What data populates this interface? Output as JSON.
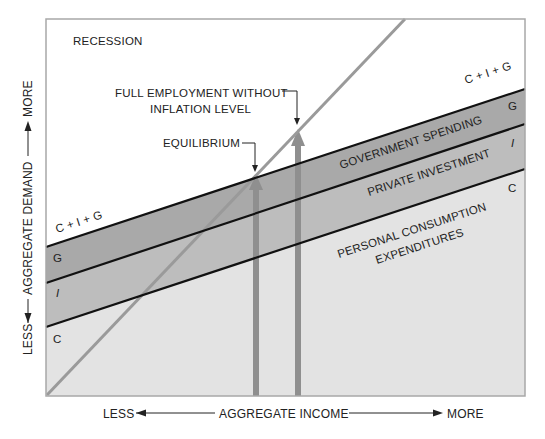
{
  "diagram": {
    "labels": {
      "recession": "RECESSION",
      "full_employment_line1": "FULL EMPLOYMENT WITHOUT",
      "full_employment_line2": "INFLATION LEVEL",
      "equilibrium": "EQUILIBRIUM",
      "cig_right": "C + I + G",
      "cig_left": "C + I + G",
      "g_right": "G",
      "i_right": "I",
      "c_right": "C",
      "g_left": "G",
      "i_left": "I",
      "c_left": "C",
      "government_spending": "GOVERNMENT SPENDING",
      "private_investment": "PRIVATE INVESTMENT",
      "personal_consumption_line1": "PERSONAL CONSUMPTION",
      "personal_consumption_line2": "EXPENDITURES"
    },
    "x_axis": {
      "less": "LESS",
      "title": "AGGREGATE INCOME",
      "more": "MORE"
    },
    "y_axis": {
      "less": "LESS",
      "title": "AGGREGATE DEMAND",
      "more": "MORE"
    },
    "colors": {
      "frame": "#a8a8a8",
      "background_top": "#ffffff",
      "consumption_fill": "#e3e3e3",
      "investment_fill": "#bdbdbd",
      "government_fill": "#a9a9a9",
      "curve_lines": "#111111",
      "diagonal": "#9a9a9a",
      "arrows": "#8f8f8f"
    }
  }
}
